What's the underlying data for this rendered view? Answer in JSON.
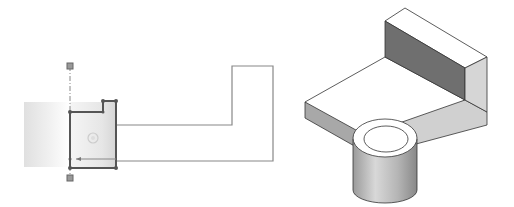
{
  "figure": {
    "sketch_view": {
      "label": "Sketch profile with selected cylinder feature",
      "colors": {
        "outline": "#777777",
        "selected": "#555555",
        "handle": "#888888",
        "shade_from": "#e2e2e2",
        "shade_to": "#ffffff"
      }
    },
    "model_view": {
      "label": "Isometric shaded solid model: L-bracket with cylindrical boss",
      "colors": {
        "top": "#ffffff",
        "dark_face": "#7a7a7a",
        "mid_face": "#c8c8c8",
        "light_face": "#dadada",
        "edge": "#333333"
      }
    }
  }
}
